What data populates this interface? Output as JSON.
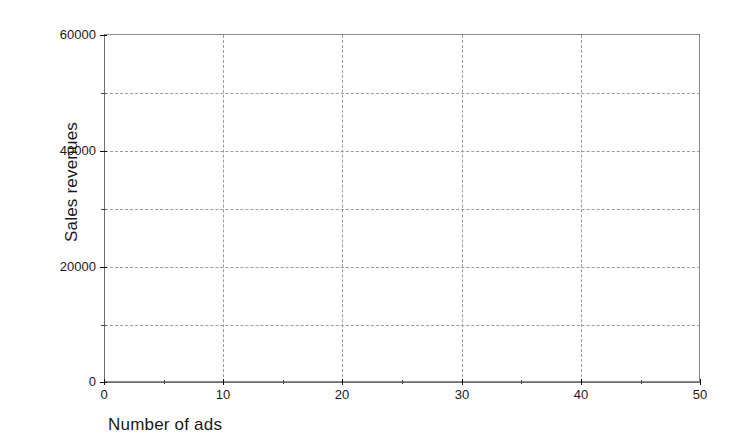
{
  "chart_data": {
    "type": "scatter",
    "title": "",
    "subtitle": "",
    "xlabel": "Number of ads",
    "ylabel": "Sales revenues",
    "xlim": [
      0,
      50
    ],
    "ylim": [
      0,
      60000
    ],
    "x_ticks": [
      0,
      10,
      20,
      30,
      40,
      50
    ],
    "x_tick_labels": [
      "0",
      "10",
      "20",
      "30",
      "40",
      "50"
    ],
    "x_minor_ticks": [
      5,
      15,
      25,
      35,
      45
    ],
    "y_ticks": [
      0,
      20000,
      40000,
      60000
    ],
    "y_tick_labels": [
      "0",
      "20000",
      "40000",
      "60000"
    ],
    "y_minor_ticks": [
      10000,
      30000,
      50000
    ],
    "grid": true,
    "grid_style": "dashed",
    "grid_x_values": [
      10,
      20,
      30,
      40
    ],
    "grid_y_values": [
      10000,
      20000,
      30000,
      40000,
      50000
    ],
    "legend": null,
    "legend_position": "none",
    "series": [
      {
        "name": "",
        "values": [],
        "x": [],
        "y": []
      }
    ],
    "annotations": [],
    "colors": {
      "background": "#ffffff",
      "plot_background": "#ffffff",
      "axis": "#6f6f6f",
      "frame": "#8a8a8a",
      "grid": "#9a9a9a",
      "tick": "#111111",
      "text": "#1a1a1a"
    }
  },
  "axes": {
    "x": {
      "title": "Number of ads",
      "ticks": [
        {
          "label": "0",
          "value": 0,
          "pos": 104
        },
        {
          "label": "10",
          "value": 10,
          "pos": 223
        },
        {
          "label": "20",
          "value": 20,
          "pos": 342
        },
        {
          "label": "30",
          "value": 30,
          "pos": 462
        },
        {
          "label": "40",
          "value": 40,
          "pos": 581
        },
        {
          "label": "50",
          "value": 50,
          "pos": 700
        }
      ],
      "minor": [
        {
          "value": 5,
          "pos": 164
        },
        {
          "value": 15,
          "pos": 283
        },
        {
          "value": 25,
          "pos": 402
        },
        {
          "value": 35,
          "pos": 521
        },
        {
          "value": 45,
          "pos": 641
        }
      ],
      "grid": [
        {
          "value": 10,
          "pos": 223
        },
        {
          "value": 20,
          "pos": 342
        },
        {
          "value": 30,
          "pos": 462
        },
        {
          "value": 40,
          "pos": 581
        }
      ]
    },
    "y": {
      "title": "Sales revenues",
      "ticks": [
        {
          "label": "60000",
          "value": 60000,
          "pos": 35
        },
        {
          "label": "40000",
          "value": 40000,
          "pos": 151
        },
        {
          "label": "20000",
          "value": 20000,
          "pos": 267
        },
        {
          "label": "0",
          "value": 0,
          "pos": 382
        }
      ],
      "minor": [
        {
          "value": 50000,
          "pos": 93
        },
        {
          "value": 30000,
          "pos": 209
        },
        {
          "value": 10000,
          "pos": 325
        }
      ],
      "grid": [
        {
          "value": 50000,
          "pos": 93
        },
        {
          "value": 40000,
          "pos": 151
        },
        {
          "value": 30000,
          "pos": 209
        },
        {
          "value": 20000,
          "pos": 267
        },
        {
          "value": 10000,
          "pos": 325
        }
      ]
    }
  }
}
